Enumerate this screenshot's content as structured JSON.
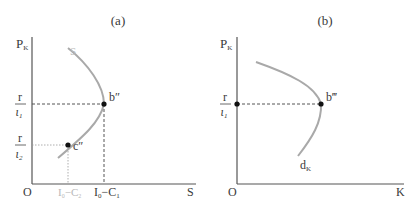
{
  "panels": [
    {
      "id": "a",
      "title": "(a)",
      "y_axis_label": "P",
      "y_axis_sub": "K",
      "x_axis_label": "S",
      "origin_label": "O",
      "curve_label": "S",
      "y_ticks": [
        {
          "num": "r",
          "den": "ι",
          "den_sub": "1"
        },
        {
          "num": "r",
          "den": "ι",
          "den_sub": "2"
        }
      ],
      "x_ticks": [
        {
          "label": "I",
          "sub": "0",
          "rest": "−C",
          "rest_sub": "2",
          "style": "light"
        },
        {
          "label": "I",
          "sub": "0",
          "rest": "−C",
          "rest_sub": "1",
          "style": "dark"
        }
      ],
      "points": [
        {
          "label": "b″"
        },
        {
          "label": "c″"
        }
      ]
    },
    {
      "id": "b",
      "title": "(b)",
      "y_axis_label": "P",
      "y_axis_sub": "K",
      "x_axis_label": "K",
      "origin_label": "O",
      "curve_label": "d",
      "curve_label_sub": "K",
      "y_ticks": [
        {
          "num": "r",
          "den": "ι",
          "den_sub": "1"
        }
      ],
      "points": [
        {
          "label": "b‴"
        }
      ]
    }
  ],
  "colors": {
    "axis": "#555555",
    "curve": "#a9a9a9",
    "point": "#111111",
    "dashed": "#555555",
    "light_text": "#b8b8b8"
  }
}
